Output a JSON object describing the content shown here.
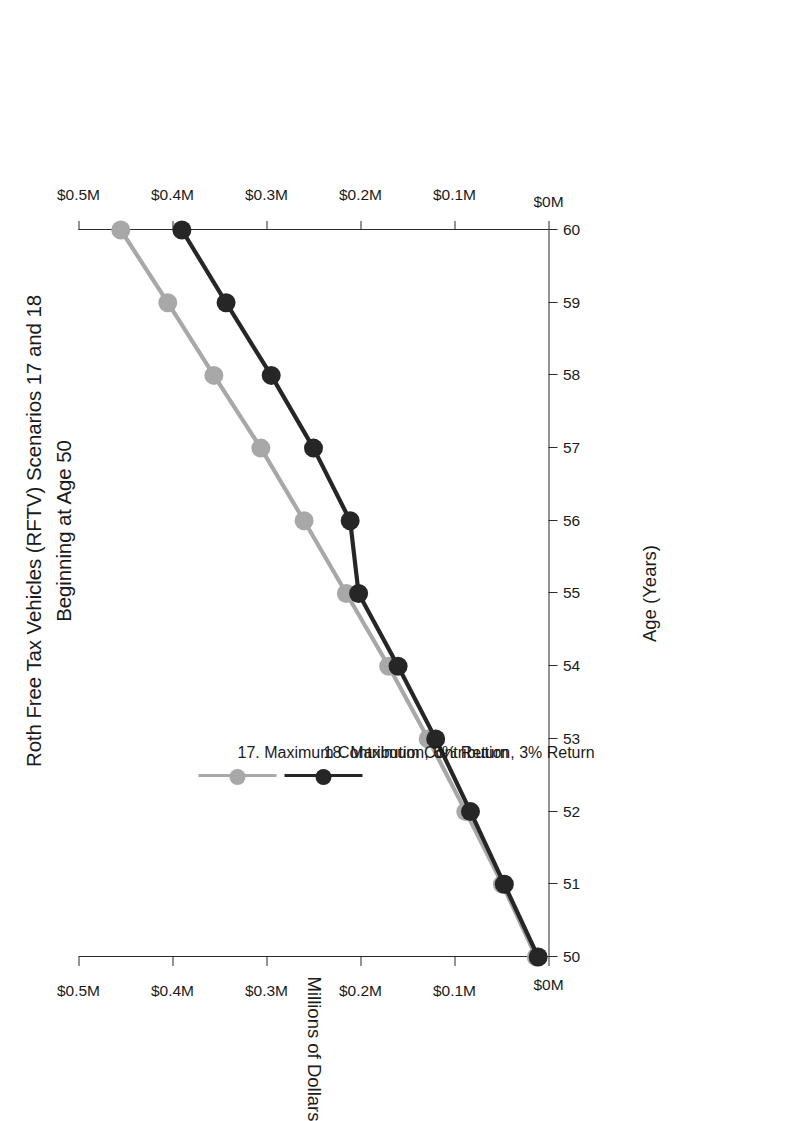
{
  "title": {
    "line1": "Roth Free Tax Vehicles (RFTV) Scenarios 17 and 18",
    "line2": "Beginning at Age 50"
  },
  "legend": {
    "items": [
      {
        "label": "17. Maximum Contribution, 6% Return",
        "color": "#a8a8a8"
      },
      {
        "label": "18. Maximum Contribution, 3% Return",
        "color": "#262626"
      }
    ]
  },
  "axes": {
    "x_title": "Age (Years)",
    "y_title": "Millions of Dollars",
    "x_ticks": [
      "50",
      "51",
      "52",
      "53",
      "54",
      "55",
      "56",
      "57",
      "58",
      "59",
      "60"
    ],
    "y_ticks": [
      "$0M",
      "$0.1M",
      "$0.2M",
      "$0.3M",
      "$0.4M",
      "$0.5M"
    ]
  },
  "chart_data": {
    "type": "line",
    "title": "Roth Free Tax Vehicles (RFTV) Scenarios 17 and 18 Beginning at Age 50",
    "xlabel": "Age (Years)",
    "ylabel": "Millions of Dollars",
    "x": [
      50,
      51,
      52,
      53,
      54,
      55,
      56,
      57,
      58,
      59,
      60
    ],
    "xlim": [
      50,
      60
    ],
    "ylim": [
      0,
      0.5
    ],
    "y_tick_values": [
      0,
      0.1,
      0.2,
      0.3,
      0.4,
      0.5
    ],
    "grid": false,
    "legend_position": "upper-left-inside",
    "units": "millions of dollars",
    "series": [
      {
        "name": "17. Maximum Contribution, 6% Return",
        "color": "#a8a8a8",
        "marker": "circle",
        "values": [
          0.013,
          0.049,
          0.088,
          0.128,
          0.17,
          0.215,
          0.26,
          0.306,
          0.356,
          0.405,
          0.455
        ]
      },
      {
        "name": "18. Maximum Contribution, 3% Return",
        "color": "#262626",
        "marker": "circle",
        "values": [
          0.011,
          0.047,
          0.083,
          0.12,
          0.16,
          0.202,
          0.211,
          0.25,
          0.295,
          0.343,
          0.39
        ]
      }
    ]
  }
}
